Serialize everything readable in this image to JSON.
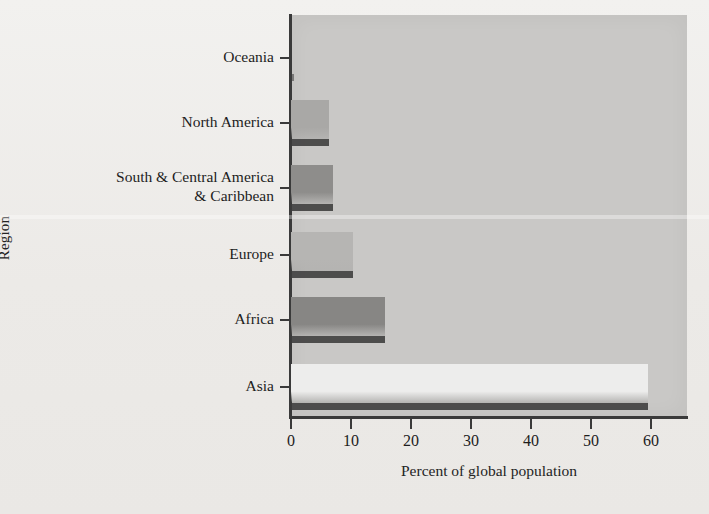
{
  "chart_data": {
    "type": "bar",
    "orientation": "horizontal",
    "title": "",
    "xlabel": "Percent of global population",
    "ylabel": "Region",
    "categories": [
      "Oceania",
      "North America",
      "South & Central America\n& Caribbean",
      "Europe",
      "Africa",
      "Asia"
    ],
    "values": [
      0.5,
      6.3,
      7.0,
      10.3,
      15.6,
      59.5
    ],
    "xlim": [
      0,
      66
    ],
    "xticks": [
      0,
      10,
      20,
      30,
      40,
      50,
      60
    ],
    "xtick_labels": [
      "0",
      "10",
      "20",
      "30",
      "40",
      "50",
      "60"
    ],
    "grid": false,
    "legend": "none",
    "bar_colors": [
      "#b9b8b6",
      "#a9a8a6",
      "#8e8d8b",
      "#b6b5b3",
      "#878684",
      "#ededec"
    ],
    "plot_background": "#c9c8c6",
    "figure_background": "#eceae7",
    "axis_color": "#3a3a3a"
  },
  "axis_titles": {
    "y": "Region",
    "x": "Percent of global population"
  }
}
